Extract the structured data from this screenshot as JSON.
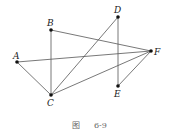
{
  "figure": {
    "caption_prefix": "图",
    "caption_number": "6-9"
  },
  "points": {
    "A": {
      "label": "A",
      "x": 17,
      "y": 62
    },
    "B": {
      "label": "B",
      "x": 51,
      "y": 30
    },
    "C": {
      "label": "C",
      "x": 51,
      "y": 95
    },
    "D": {
      "label": "D",
      "x": 118,
      "y": 17
    },
    "E": {
      "label": "E",
      "x": 118,
      "y": 86
    },
    "F": {
      "label": "F",
      "x": 151,
      "y": 51
    }
  },
  "edges": [
    [
      "A",
      "F"
    ],
    [
      "A",
      "C"
    ],
    [
      "B",
      "C"
    ],
    [
      "B",
      "F"
    ],
    [
      "C",
      "D"
    ],
    [
      "C",
      "F"
    ],
    [
      "D",
      "E"
    ],
    [
      "E",
      "F"
    ]
  ]
}
